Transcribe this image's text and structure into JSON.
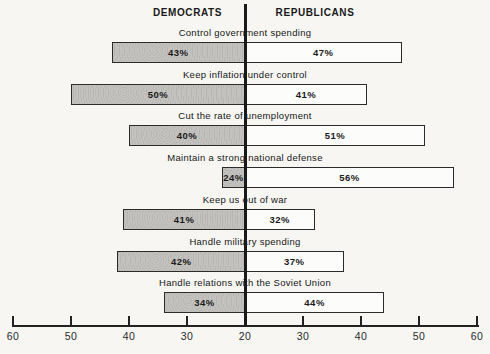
{
  "chart_data": {
    "type": "bar",
    "subtype": "diverging-horizontal",
    "title": "",
    "left_header": "DEMOCRATS",
    "right_header": "REPUBLICANS",
    "categories": [
      "Control government spending",
      "Keep inflation under control",
      "Cut the rate of unemployment",
      "Maintain a strong national defense",
      "Keep us out of war",
      "Handle military spending",
      "Handle relations with the Soviet Union"
    ],
    "series": [
      {
        "name": "Democrats",
        "values": [
          43,
          50,
          40,
          24,
          41,
          42,
          34
        ]
      },
      {
        "name": "Republicans",
        "values": [
          47,
          41,
          51,
          56,
          32,
          37,
          44
        ]
      }
    ],
    "value_suffix": "%",
    "value_labels": {
      "democrats": [
        "43%",
        "50%",
        "40%",
        "24%",
        "41%",
        "42%",
        "34%"
      ],
      "republicans": [
        "47%",
        "41%",
        "51%",
        "56%",
        "32%",
        "37%",
        "44%"
      ]
    },
    "axis": {
      "orientation": "horizontal-mirrored",
      "center_value": 20,
      "max_value": 60,
      "center_label": "20",
      "side_tick_labels": [
        30,
        40,
        50,
        60
      ],
      "tick_labels_full": [
        "60",
        "50",
        "40",
        "30",
        "20",
        "30",
        "40",
        "50",
        "60"
      ],
      "grid": false
    },
    "legend_position": "none",
    "colors": {
      "democrat_fill": "#c3c2bf",
      "republican_fill": "#fcfcfa",
      "bar_border": "#2b2b2b",
      "axis_color": "#222222",
      "text_color": "#1a1a1a",
      "background": "#f7f6f3"
    }
  }
}
